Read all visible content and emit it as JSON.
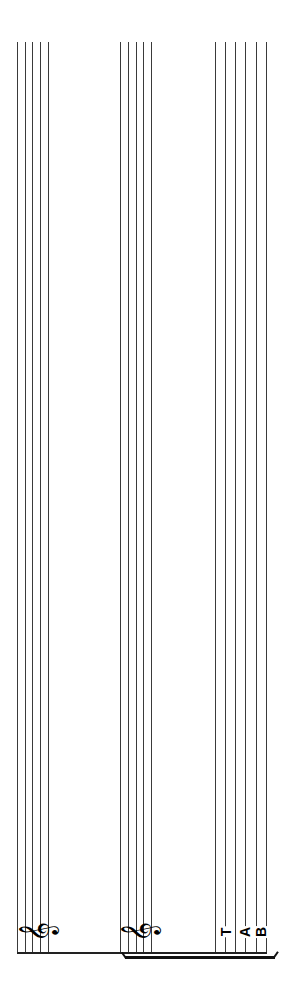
{
  "score": {
    "orientation": "rotated -90deg",
    "staves": [
      {
        "name": "staff-1",
        "type": "standard",
        "clef": "treble",
        "clef_glyph": "𝄞",
        "line_x": [
          17,
          25,
          32,
          40,
          48
        ]
      },
      {
        "name": "staff-2",
        "type": "standard",
        "clef": "treble",
        "clef_glyph": "𝄞",
        "line_x": [
          120,
          128,
          136,
          143,
          151
        ]
      },
      {
        "name": "tab-staff",
        "type": "tablature",
        "clef": "TAB",
        "tab_letters": [
          "T",
          "A",
          "B"
        ],
        "line_x": [
          215,
          225,
          235,
          245,
          256,
          266
        ]
      }
    ],
    "bracket": {
      "from_staff": "staff-2",
      "to_staff": "tab-staff"
    },
    "colors": {
      "lines": "#3a3a3a",
      "glyphs": "#000000",
      "background": "#ffffff"
    }
  }
}
